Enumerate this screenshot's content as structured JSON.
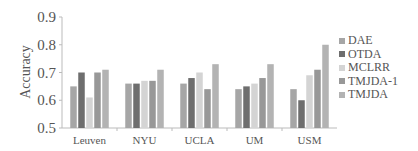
{
  "chart_data": {
    "type": "bar",
    "title": "",
    "xlabel": "",
    "ylabel": "Accuracy",
    "ylim": [
      0.5,
      0.9
    ],
    "yticks": [
      "0.5",
      "0.6",
      "0.7",
      "0.8",
      "0.9"
    ],
    "grid": false,
    "legend_position": "right",
    "categories": [
      "Leuven",
      "NYU",
      "UCLA",
      "UM",
      "USM"
    ],
    "series": [
      {
        "name": "DAE",
        "color": "#a6a6a6",
        "values": [
          0.65,
          0.66,
          0.66,
          0.64,
          0.64
        ]
      },
      {
        "name": "OTDA",
        "color": "#6e6e6e",
        "values": [
          0.7,
          0.66,
          0.68,
          0.65,
          0.6
        ]
      },
      {
        "name": "MCLRR",
        "color": "#d4d4d4",
        "values": [
          0.61,
          0.67,
          0.7,
          0.66,
          0.69
        ]
      },
      {
        "name": "TMJDA-1",
        "color": "#989898",
        "values": [
          0.7,
          0.67,
          0.64,
          0.68,
          0.71
        ]
      },
      {
        "name": "TMJDA",
        "color": "#b3b3b3",
        "values": [
          0.71,
          0.71,
          0.73,
          0.73,
          0.8
        ]
      }
    ]
  }
}
